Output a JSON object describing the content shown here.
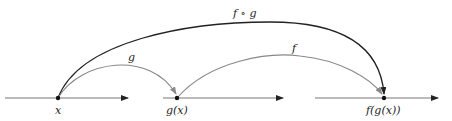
{
  "diagram": {
    "colors": {
      "axis": "#222222",
      "compose": "#222222",
      "map": "#888888"
    },
    "points": [
      {
        "label": "x",
        "cx": 58
      },
      {
        "label": "g(x)",
        "cx": 177
      },
      {
        "label": "f(g(x))",
        "cx": 384
      }
    ],
    "arrows": [
      {
        "label": "g",
        "from": "x",
        "to": "g(x)"
      },
      {
        "label": "f",
        "from": "g(x)",
        "to": "f(g(x))"
      },
      {
        "label": "f ∘ g",
        "from": "x",
        "to": "f(g(x))"
      }
    ]
  }
}
